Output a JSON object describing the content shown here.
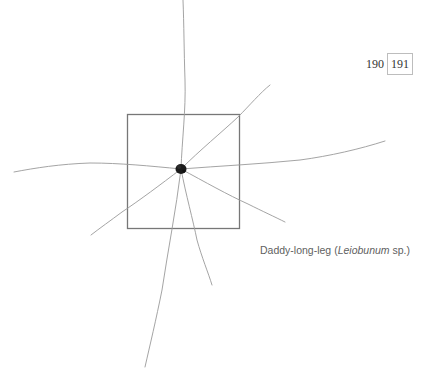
{
  "page_numbers": {
    "previous": "190",
    "current": "191"
  },
  "caption": {
    "common_name": "Daddy-long-leg",
    "open_paren": " (",
    "scientific_name": "Leiobunum",
    "suffix": " sp.)"
  },
  "illustration": {
    "subject": "daddy-long-leg-specimen",
    "frame_color": "#777777",
    "leg_color": "#9a9a9a",
    "body_color": "#1a1a1a"
  }
}
